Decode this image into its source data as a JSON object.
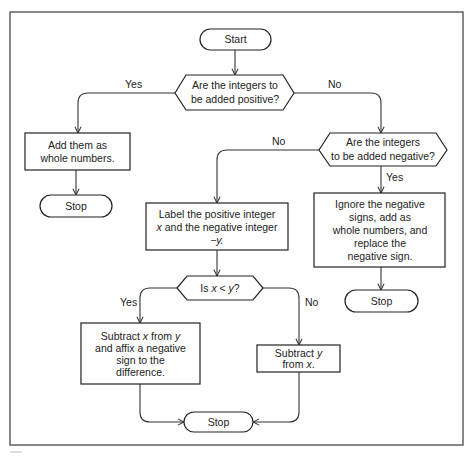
{
  "flowchart": {
    "start": "Start",
    "decision1": {
      "line1": "Are the integers to",
      "line2": "be added positive?",
      "yes": "Yes",
      "no": "No"
    },
    "add_positive": {
      "line1": "Add them as",
      "line2": "whole numbers."
    },
    "stop1": "Stop",
    "decision2": {
      "line1": "Are the integers",
      "line2": "to be added negative?",
      "yes": "Yes",
      "no": "No"
    },
    "add_negative": {
      "line1": "Ignore the negative",
      "line2": "signs, add as",
      "line3": "whole numbers, and",
      "line4": "replace the",
      "line5": "negative sign."
    },
    "stop2": "Stop",
    "label_box": {
      "line1": "Label the positive integer",
      "line2_var": "x",
      "line2_rest": " and the negative integer",
      "line3": "−y."
    },
    "decision3": {
      "pre": "Is ",
      "var_x": "x",
      "op": " < ",
      "var_y": "y",
      "post": "?",
      "yes": "Yes",
      "no": "No"
    },
    "subtract_x": {
      "line1_pre": "Subtract ",
      "line1_x": "x",
      "line1_mid": " from ",
      "line1_y": "y",
      "line2": "and affix a negative",
      "line3": "sign to the",
      "line4": "difference."
    },
    "subtract_y": {
      "line1_pre": "Subtract ",
      "line1_y": "y",
      "line2_pre": "from ",
      "line2_x": "x",
      "line2_post": "."
    },
    "stop3": "Stop"
  }
}
